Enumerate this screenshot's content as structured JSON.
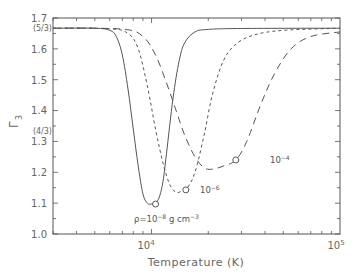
{
  "chart_data": {
    "type": "line",
    "title": "",
    "xlabel": "Temperature (K)",
    "ylabel": "Γ3",
    "xscale": "log",
    "xlim": [
      3000,
      100000
    ],
    "ylim": [
      1.0,
      1.7
    ],
    "x_tick_labels": [
      "10^4",
      "10^5"
    ],
    "x_tick_values": [
      10000,
      100000
    ],
    "y_tick_labels": [
      "1.0",
      "1.1",
      "1.2",
      "1.3",
      "1.4",
      "1.5",
      "1.6",
      "1.7"
    ],
    "y_tick_values": [
      1.0,
      1.1,
      1.2,
      1.3,
      1.4,
      1.5,
      1.6,
      1.7
    ],
    "y_special_labels": [
      {
        "label": "(5/3)",
        "value": 1.6667
      },
      {
        "label": "(4/3)",
        "value": 1.3333
      }
    ],
    "grid": false,
    "legend": null,
    "series": [
      {
        "name": "ρ=10^-8 g cm^-3",
        "style": "solid",
        "x": [
          3000,
          5000,
          6000,
          6500,
          7000,
          7500,
          8000,
          8500,
          9000,
          9500,
          10000,
          10500,
          11000,
          11500,
          12000,
          13000,
          14000,
          15000,
          17000,
          20000,
          30000,
          100000
        ],
        "values": [
          1.667,
          1.667,
          1.66,
          1.64,
          1.58,
          1.47,
          1.34,
          1.22,
          1.13,
          1.1,
          1.097,
          1.1,
          1.12,
          1.17,
          1.26,
          1.44,
          1.56,
          1.62,
          1.655,
          1.663,
          1.666,
          1.667
        ],
        "marker": {
          "x": 10500,
          "y": 1.097
        }
      },
      {
        "name": "10^-6",
        "style": "dashed-short",
        "x": [
          3000,
          6000,
          7500,
          8500,
          9500,
          10500,
          11500,
          12500,
          13500,
          14500,
          15500,
          17000,
          19000,
          21000,
          24000,
          28000,
          35000,
          50000,
          100000
        ],
        "values": [
          1.667,
          1.665,
          1.65,
          1.6,
          1.48,
          1.34,
          1.23,
          1.16,
          1.135,
          1.14,
          1.15,
          1.2,
          1.32,
          1.45,
          1.56,
          1.615,
          1.645,
          1.66,
          1.667
        ],
        "marker": {
          "x": 15200,
          "y": 1.143
        }
      },
      {
        "name": "10^-4",
        "style": "dashed-long",
        "x": [
          3000,
          7000,
          9000,
          10500,
          12000,
          13500,
          15000,
          17000,
          19000,
          21000,
          24000,
          28000,
          32000,
          38000,
          45000,
          55000,
          70000,
          100000
        ],
        "values": [
          1.667,
          1.664,
          1.64,
          1.58,
          1.49,
          1.4,
          1.32,
          1.25,
          1.215,
          1.21,
          1.22,
          1.24,
          1.3,
          1.42,
          1.52,
          1.6,
          1.64,
          1.655
        ],
        "marker": {
          "x": 28000,
          "y": 1.24
        }
      }
    ],
    "annotations": [
      {
        "text": "ρ=10^-8 g cm^-3",
        "near_series": "ρ=10^-8 g cm^-3"
      },
      {
        "text": "10^-6",
        "near_series": "10^-6"
      },
      {
        "text": "10^-4",
        "near_series": "10^-4"
      }
    ]
  },
  "labels": {
    "xlabel": "Temperature (K)",
    "ylabel_main": "Γ",
    "ylabel_sub": "3",
    "x_tick_1_base": "10",
    "x_tick_1_exp": "4",
    "x_tick_2_base": "10",
    "x_tick_2_exp": "5",
    "y_ticks": [
      "1.0",
      "1.1",
      "1.2",
      "1.3",
      "1.4",
      "1.5",
      "1.6",
      "1.7"
    ],
    "y_special_53": "(5/3)",
    "y_special_43": "(4/3)",
    "annot_rho8_prefix": "ρ=10",
    "annot_rho8_exp": "−8",
    "annot_rho8_units": " g cm",
    "annot_rho8_units_exp": "−3",
    "annot_rho6_base": "10",
    "annot_rho6_exp": "−6",
    "annot_rho4_base": "10",
    "annot_rho4_exp": "−4"
  },
  "colors": {
    "axis": "#555555",
    "curve": "#555555",
    "text": "#666666"
  }
}
